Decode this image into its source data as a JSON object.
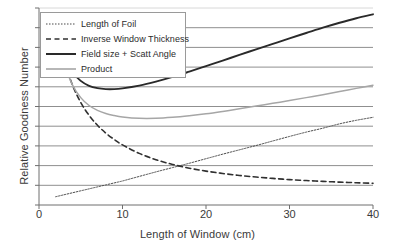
{
  "chart_data": {
    "type": "line",
    "title": "",
    "xlabel": "Length of Window (cm)",
    "ylabel": "Relative Goodness Number",
    "xlim": [
      0,
      40
    ],
    "ylim": [
      0,
      10
    ],
    "xticks": [
      0,
      10,
      20,
      30,
      40
    ],
    "xticklabels": [
      "0",
      "10",
      "20",
      "30",
      "40"
    ],
    "yticks": [
      0,
      1,
      2,
      3,
      4,
      5,
      6,
      7,
      8,
      9,
      10
    ],
    "yticklabels": [
      "",
      "",
      "",
      "",
      "",
      "",
      "",
      "",
      "",
      "",
      ""
    ],
    "grid": "horizontal",
    "legend_position": "upper-left",
    "x": [
      2,
      3,
      4,
      5,
      6,
      7,
      8,
      9,
      10,
      12,
      14,
      16,
      18,
      20,
      22,
      24,
      26,
      28,
      30,
      32,
      34,
      36,
      38,
      40
    ],
    "series": [
      {
        "name": "Length of Foil",
        "style": "dotted",
        "color": "#4a4a4a",
        "width": 1,
        "values": [
          0.42,
          0.52,
          0.62,
          0.72,
          0.82,
          0.92,
          1.02,
          1.12,
          1.22,
          1.45,
          1.68,
          1.9,
          2.12,
          2.35,
          2.58,
          2.8,
          3.02,
          3.25,
          3.48,
          3.7,
          3.9,
          4.12,
          4.3,
          4.45
        ]
      },
      {
        "name": "Inverse Window Thickness",
        "style": "dashed",
        "color": "#303030",
        "width": 1.6,
        "values": [
          8.85,
          7.35,
          6.1,
          5.2,
          4.55,
          4.05,
          3.65,
          3.33,
          3.05,
          2.62,
          2.3,
          2.06,
          1.87,
          1.72,
          1.6,
          1.5,
          1.42,
          1.35,
          1.29,
          1.24,
          1.2,
          1.16,
          1.13,
          1.1
        ]
      },
      {
        "name": "Field size + Scatt Angle",
        "style": "solid",
        "color": "#2a2a2a",
        "width": 1.9,
        "values": [
          8.85,
          7.6,
          6.75,
          6.3,
          6.05,
          5.93,
          5.88,
          5.88,
          5.92,
          6.06,
          6.26,
          6.5,
          6.77,
          7.05,
          7.33,
          7.62,
          7.9,
          8.18,
          8.46,
          8.73,
          9.0,
          9.25,
          9.48,
          9.68
        ]
      },
      {
        "name": "Product",
        "style": "solid",
        "color": "#a6a6a6",
        "width": 1.5,
        "values": [
          8.8,
          7.2,
          6.1,
          5.45,
          5.05,
          4.8,
          4.64,
          4.54,
          4.47,
          4.4,
          4.4,
          4.45,
          4.53,
          4.63,
          4.75,
          4.88,
          5.02,
          5.16,
          5.3,
          5.45,
          5.6,
          5.76,
          5.92,
          6.08
        ]
      }
    ]
  },
  "legend": {
    "items": [
      {
        "label": "Length of Foil"
      },
      {
        "label": "Inverse Window Thickness"
      },
      {
        "label": "Field size + Scatt Angle"
      },
      {
        "label": "Product"
      }
    ]
  }
}
